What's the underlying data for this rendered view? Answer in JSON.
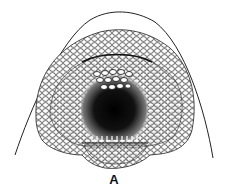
{
  "figure": {
    "panel_label": "A",
    "colors": {
      "ink": "#111111",
      "paper": "#ffffff"
    }
  }
}
